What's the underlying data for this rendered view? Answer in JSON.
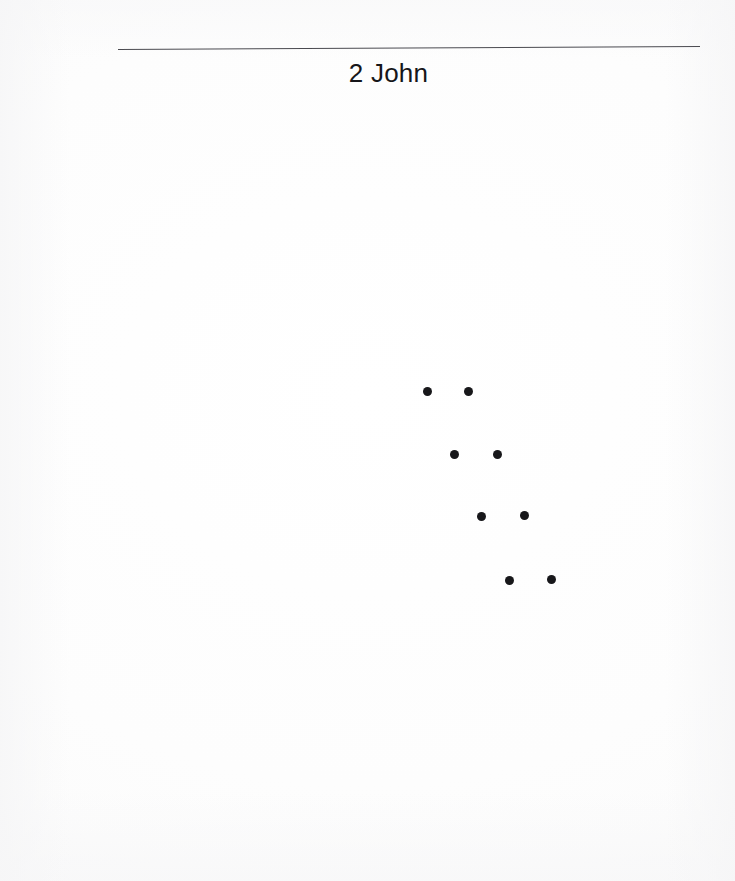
{
  "page": {
    "background_color": "#ffffff",
    "width": 735,
    "height": 881,
    "kind": "scanned-book-page"
  },
  "header": {
    "title": "2 John",
    "title_color": "#16161a",
    "rule": {
      "name": "horizontal-rule",
      "color": "#4a4a50",
      "x_start": 118,
      "x_end": 700,
      "y_start": 50,
      "y_end": 47,
      "thickness": 1
    }
  },
  "ornament": {
    "label": "dot-pattern",
    "description": "Eight filled dots arranged as four horizontal pairs stepping down and to the right.",
    "dot_color": "#17171a",
    "dot_diameter": 9,
    "row_count": 4,
    "dots_per_row": 2,
    "rows": [
      {
        "index": 1,
        "y": 391,
        "dots": [
          {
            "x": 427,
            "y": 391
          },
          {
            "x": 468,
            "y": 391
          }
        ]
      },
      {
        "index": 2,
        "y": 454,
        "dots": [
          {
            "x": 454,
            "y": 454
          },
          {
            "x": 497,
            "y": 454
          }
        ]
      },
      {
        "index": 3,
        "y": 516,
        "dots": [
          {
            "x": 481,
            "y": 516
          },
          {
            "x": 524,
            "y": 515
          }
        ]
      },
      {
        "index": 4,
        "y": 579,
        "dots": [
          {
            "x": 509,
            "y": 580
          },
          {
            "x": 551,
            "y": 579
          }
        ]
      }
    ]
  },
  "body": {
    "content": "",
    "note": "Page body is blank."
  }
}
